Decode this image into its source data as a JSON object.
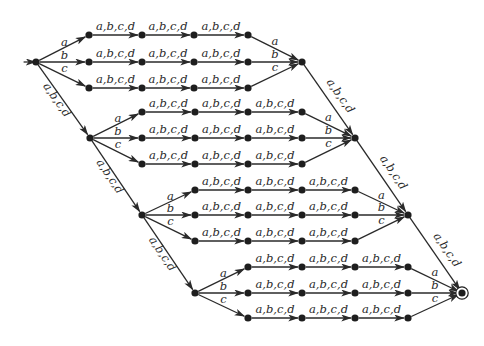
{
  "diagram": {
    "type": "finite-automaton",
    "alphabet": [
      "a",
      "b",
      "c",
      "d"
    ],
    "colors": {
      "ink": "#2a2a2a",
      "node": "#1e1e1e",
      "background": "#ffffff"
    },
    "labels": {
      "any": "a,b,c,d",
      "a": "a",
      "b": "b",
      "c": "c"
    },
    "start_state": "s0",
    "accepting_state": "f",
    "blocks": [
      {
        "id": "block-1",
        "branch_node": {
          "x": 36,
          "y": 62
        },
        "merge_node": {
          "x": 302,
          "y": 62
        },
        "rows": [
          {
            "symbol": "a",
            "y": 35,
            "xs": [
              89,
              142,
              194,
              248
            ]
          },
          {
            "symbol": "b",
            "y": 62,
            "xs": [
              89,
              142,
              194,
              248
            ]
          },
          {
            "symbol": "c",
            "y": 88,
            "xs": [
              89,
              142,
              194,
              248
            ]
          }
        ]
      },
      {
        "id": "block-2",
        "branch_node": {
          "x": 90,
          "y": 138
        },
        "merge_node": {
          "x": 355,
          "y": 138
        },
        "rows": [
          {
            "symbol": "a",
            "y": 112,
            "xs": [
              142,
              195,
              248,
              302
            ]
          },
          {
            "symbol": "b",
            "y": 138,
            "xs": [
              142,
              195,
              248,
              302
            ]
          },
          {
            "symbol": "c",
            "y": 164,
            "xs": [
              142,
              195,
              248,
              302
            ]
          }
        ]
      },
      {
        "id": "block-3",
        "branch_node": {
          "x": 142,
          "y": 215
        },
        "merge_node": {
          "x": 408,
          "y": 215
        },
        "rows": [
          {
            "symbol": "a",
            "y": 190,
            "xs": [
              195,
              248,
              302,
              355
            ]
          },
          {
            "symbol": "b",
            "y": 215,
            "xs": [
              195,
              248,
              302,
              355
            ]
          },
          {
            "symbol": "c",
            "y": 241,
            "xs": [
              195,
              248,
              302,
              355
            ]
          }
        ]
      },
      {
        "id": "block-4",
        "branch_node": {
          "x": 195,
          "y": 293
        },
        "merge_node": {
          "x": 462,
          "y": 293
        },
        "rows": [
          {
            "symbol": "a",
            "y": 267,
            "xs": [
              248,
              302,
              355,
              408
            ]
          },
          {
            "symbol": "b",
            "y": 293,
            "xs": [
              248,
              302,
              355,
              408
            ]
          },
          {
            "symbol": "c",
            "y": 318,
            "xs": [
              248,
              302,
              355,
              408
            ]
          }
        ]
      }
    ],
    "diagonal_chains": [
      {
        "id": "down-left-1",
        "from": "block-1.branch",
        "to": "block-2.branch",
        "label": "a,b,c,d"
      },
      {
        "id": "down-left-2",
        "from": "block-2.branch",
        "to": "block-3.branch",
        "label": "a,b,c,d"
      },
      {
        "id": "down-left-3",
        "from": "block-3.branch",
        "to": "block-4.branch",
        "label": "a,b,c,d"
      },
      {
        "id": "down-right-1",
        "from": "block-1.merge",
        "to": "block-2.merge",
        "label": "a,b,c,d"
      },
      {
        "id": "down-right-2",
        "from": "block-2.merge",
        "to": "block-3.merge",
        "label": "a,b,c,d"
      },
      {
        "id": "down-right-3",
        "from": "block-3.merge",
        "to": "block-4.merge",
        "label": "a,b,c,d"
      }
    ],
    "start_arrow": {
      "from_x": 20,
      "label": ""
    }
  }
}
